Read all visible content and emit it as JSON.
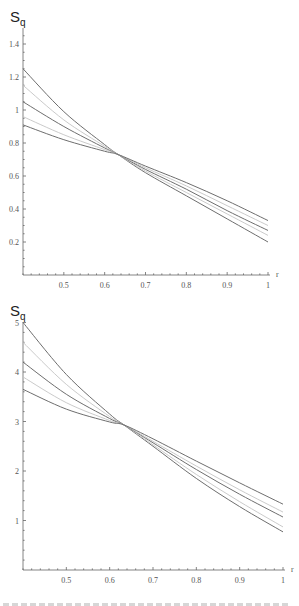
{
  "chart_data": [
    {
      "type": "line",
      "title": "",
      "ylabel": "S_q",
      "ylabel_main": "S",
      "ylabel_sub": "q",
      "xlabel": "r",
      "xlim": [
        0.4,
        1.0
      ],
      "ylim": [
        0,
        1.5
      ],
      "x_ticks": [
        "0.5",
        "0.6",
        "0.7",
        "0.8",
        "0.9",
        "1"
      ],
      "y_ticks": [
        "0.2",
        "0.4",
        "0.6",
        "0.8",
        "1",
        "1.2",
        "1.4"
      ],
      "grid": false,
      "legend": null,
      "annotation": "all curves cross near r≈0.63, S_q≈0.73",
      "x": [
        0.4,
        0.5,
        0.6,
        0.633,
        0.7,
        0.8,
        0.9,
        1.0
      ],
      "series": [
        {
          "name": "curve-1",
          "shade": "dark",
          "values": [
            1.25,
            0.99,
            0.79,
            0.73,
            0.62,
            0.48,
            0.34,
            0.2
          ]
        },
        {
          "name": "curve-2",
          "shade": "light",
          "values": [
            1.15,
            0.94,
            0.78,
            0.73,
            0.63,
            0.5,
            0.37,
            0.24
          ]
        },
        {
          "name": "curve-3",
          "shade": "dark",
          "values": [
            1.05,
            0.9,
            0.77,
            0.73,
            0.64,
            0.52,
            0.39,
            0.27
          ]
        },
        {
          "name": "curve-4",
          "shade": "light",
          "values": [
            0.96,
            0.85,
            0.76,
            0.73,
            0.65,
            0.54,
            0.42,
            0.3
          ]
        },
        {
          "name": "curve-5",
          "shade": "dark",
          "values": [
            0.91,
            0.82,
            0.75,
            0.73,
            0.66,
            0.56,
            0.45,
            0.33
          ]
        }
      ]
    },
    {
      "type": "line",
      "title": "",
      "ylabel": "S_q",
      "ylabel_main": "S",
      "ylabel_sub": "q",
      "xlabel": "r",
      "xlim": [
        0.4,
        1.0
      ],
      "ylim": [
        0,
        5.1
      ],
      "x_ticks": [
        "0.5",
        "0.6",
        "0.7",
        "0.8",
        "0.9",
        "1"
      ],
      "y_ticks": [
        "1",
        "2",
        "3",
        "4",
        "5"
      ],
      "grid": false,
      "legend": null,
      "annotation": "all curves cross near r≈0.63, S_q≈2.93",
      "x": [
        0.4,
        0.5,
        0.6,
        0.633,
        0.7,
        0.8,
        0.9,
        1.0
      ],
      "series": [
        {
          "name": "curve-1",
          "shade": "dark",
          "values": [
            5.0,
            3.95,
            3.15,
            2.93,
            2.5,
            1.85,
            1.28,
            0.77
          ]
        },
        {
          "name": "curve-2",
          "shade": "light",
          "values": [
            4.6,
            3.75,
            3.1,
            2.93,
            2.53,
            1.93,
            1.38,
            0.87
          ]
        },
        {
          "name": "curve-3",
          "shade": "dark",
          "values": [
            4.2,
            3.55,
            3.06,
            2.93,
            2.57,
            2.03,
            1.53,
            1.07
          ]
        },
        {
          "name": "curve-4",
          "shade": "light",
          "values": [
            3.9,
            3.38,
            3.02,
            2.93,
            2.6,
            2.1,
            1.62,
            1.17
          ]
        },
        {
          "name": "curve-5",
          "shade": "dark",
          "values": [
            3.65,
            3.25,
            2.99,
            2.93,
            2.65,
            2.2,
            1.76,
            1.33
          ]
        }
      ]
    }
  ],
  "style": {
    "axis_color": "#666666",
    "dark_line_color": "#6e6e6e",
    "light_line_color": "#c4c4c4"
  }
}
